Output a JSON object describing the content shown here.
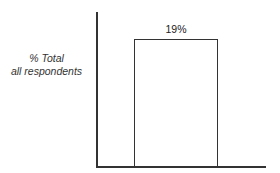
{
  "chart_data": {
    "type": "bar",
    "title": "",
    "xlabel": "",
    "ylabel": "% Total all respondents",
    "ylabel_lines": [
      "% Total",
      "all respondents"
    ],
    "categories": [
      ""
    ],
    "values": [
      19
    ],
    "data_labels": [
      "19%"
    ],
    "ylim": [
      0,
      23
    ],
    "grid": false,
    "legend": null,
    "colors": {
      "bar_fill": "#ffffff",
      "bar_stroke": "#333333",
      "axis": "#333333"
    }
  }
}
